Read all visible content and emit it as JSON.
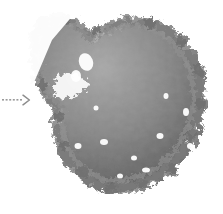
{
  "figure": {
    "type": "photograph-with-annotation",
    "background_color": "#ffffff",
    "width": 223,
    "height": 214,
    "colorspace": "grayscale"
  },
  "annotation": {
    "arrow": {
      "name": "dotted-arrow-right",
      "style": "dotted",
      "direction": "right",
      "dot_count": 6,
      "color": "#9a9a9a",
      "head_color": "#8c8c8c",
      "x": 2,
      "y": 92,
      "width": 30,
      "height": 16
    }
  },
  "subject": {
    "name": "curly-kale-leaf",
    "label": "Curly kale leaf",
    "description": "Grayscale photograph of a single curly kale leaf isolated on a white background",
    "bounding_box": {
      "x": 18,
      "y": 12,
      "width": 188,
      "height": 180
    },
    "colors": {
      "shadow": "#3a3a3a",
      "dark": "#545454",
      "mid": "#7c7c7c",
      "light": "#a8a8a8",
      "highlight": "#cfcfcf",
      "vein": "#4a4a4a",
      "background": "#ffffff"
    }
  }
}
